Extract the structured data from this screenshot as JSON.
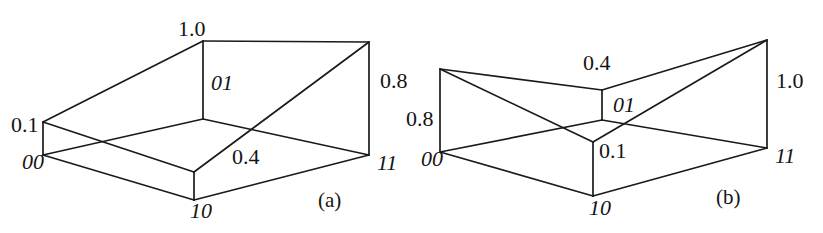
{
  "figure": {
    "panels": [
      {
        "id": "panel-a",
        "caption": "(a)",
        "nodes": [
          {
            "name": "node-00",
            "label": "00"
          },
          {
            "name": "node-01",
            "label": "01"
          },
          {
            "name": "node-10",
            "label": "10"
          },
          {
            "name": "node-11",
            "label": "11"
          }
        ],
        "weights": [
          {
            "name": "weight-00",
            "label": "0.1"
          },
          {
            "name": "weight-01",
            "label": "1.0"
          },
          {
            "name": "weight-10",
            "label": "0.4"
          },
          {
            "name": "weight-11",
            "label": "0.8"
          }
        ]
      },
      {
        "id": "panel-b",
        "caption": "(b)",
        "nodes": [
          {
            "name": "node-00",
            "label": "00"
          },
          {
            "name": "node-01",
            "label": "01"
          },
          {
            "name": "node-10",
            "label": "10"
          },
          {
            "name": "node-11",
            "label": "11"
          }
        ],
        "weights": [
          {
            "name": "weight-00",
            "label": "0.8"
          },
          {
            "name": "weight-01",
            "label": "0.4"
          },
          {
            "name": "weight-10",
            "label": "0.1"
          },
          {
            "name": "weight-11",
            "label": "1.0"
          }
        ]
      }
    ],
    "colors": {
      "line": "#1a1a1a",
      "text": "#141414",
      "background": "#ffffff"
    }
  }
}
